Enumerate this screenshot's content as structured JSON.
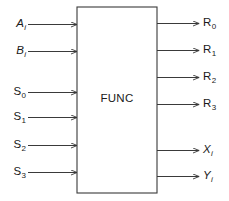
{
  "diagram": {
    "type": "block-diagram",
    "block": {
      "label": "FUNC",
      "x": 77,
      "y": 7,
      "width": 80,
      "height": 186,
      "stroke": "#3a3a3a",
      "fill": "#ffffff"
    },
    "line_color": "#3a3a3a",
    "text_color": "#1a1a1a",
    "background": "#ffffff",
    "inputs": [
      {
        "base": "A",
        "sub": "i",
        "italic": true,
        "y": 24,
        "label_x": 10,
        "line_start": 28
      },
      {
        "base": "B",
        "sub": "i",
        "italic": true,
        "y": 51,
        "label_x": 10,
        "line_start": 28
      },
      {
        "base": "S",
        "sub": "0",
        "italic": false,
        "y": 92,
        "label_x": 10,
        "line_start": 28
      },
      {
        "base": "S",
        "sub": "1",
        "italic": false,
        "y": 117,
        "label_x": 10,
        "line_start": 28
      },
      {
        "base": "S",
        "sub": "2",
        "italic": false,
        "y": 145,
        "label_x": 10,
        "line_start": 28
      },
      {
        "base": "S",
        "sub": "3",
        "italic": false,
        "y": 172,
        "label_x": 10,
        "line_start": 28
      }
    ],
    "outputs": [
      {
        "base": "R",
        "sub": "0",
        "italic": false,
        "y": 23,
        "label_x": 203,
        "line_end": 199
      },
      {
        "base": "R",
        "sub": "1",
        "italic": false,
        "y": 50,
        "label_x": 203,
        "line_end": 199
      },
      {
        "base": "R",
        "sub": "2",
        "italic": false,
        "y": 77,
        "label_x": 203,
        "line_end": 199
      },
      {
        "base": "R",
        "sub": "3",
        "italic": false,
        "y": 104,
        "label_x": 203,
        "line_end": 199
      },
      {
        "base": "X",
        "sub": "i",
        "italic": true,
        "y": 150,
        "label_x": 203,
        "line_end": 199
      },
      {
        "base": "Y",
        "sub": "i",
        "italic": true,
        "y": 176,
        "label_x": 203,
        "line_end": 199
      }
    ]
  }
}
